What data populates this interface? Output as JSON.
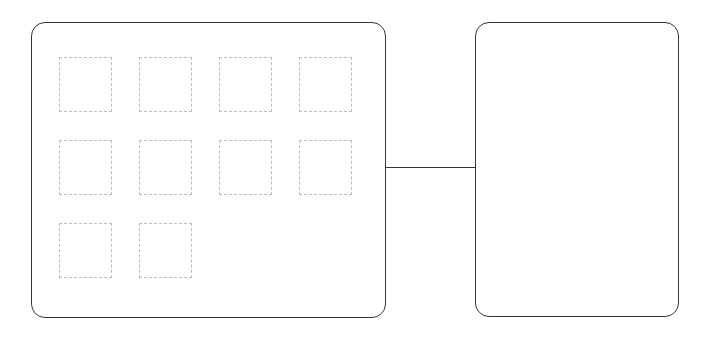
{
  "page": {
    "background_color": "#ffffff",
    "width": 712,
    "height": 339
  },
  "colors": {
    "panel_border": "#343434",
    "placeholder_border": "#bdbdbd",
    "connector": "#343434",
    "surface": "#ffffff"
  },
  "content_panel": {
    "name": "content-panel",
    "label": "",
    "border_style": "solid",
    "corner_radius": 14,
    "x": 31,
    "y": 22,
    "width": 355,
    "height": 296,
    "grid": {
      "rows": [
        {
          "row_index": 1,
          "boxes": [
            {
              "label": "",
              "id": "placeholder-1"
            },
            {
              "label": "",
              "id": "placeholder-2"
            },
            {
              "label": "",
              "id": "placeholder-3"
            },
            {
              "label": "",
              "id": "placeholder-4"
            }
          ]
        },
        {
          "row_index": 2,
          "boxes": [
            {
              "label": "",
              "id": "placeholder-5"
            },
            {
              "label": "",
              "id": "placeholder-6"
            },
            {
              "label": "",
              "id": "placeholder-7"
            },
            {
              "label": "",
              "id": "placeholder-8"
            }
          ]
        },
        {
          "row_index": 3,
          "boxes": [
            {
              "label": "",
              "id": "placeholder-9"
            },
            {
              "label": "",
              "id": "placeholder-10"
            }
          ]
        }
      ],
      "box_count": 10,
      "box_width": 53,
      "box_height": 55,
      "column_gap": 27,
      "row_gap": 28,
      "border_style": "dashed"
    }
  },
  "connector": {
    "name": "connector-line",
    "orientation": "horizontal",
    "from": "content-panel",
    "to": "detail-panel",
    "x": 385,
    "y": 167,
    "length": 91,
    "thickness": 1.4
  },
  "detail_panel": {
    "name": "detail-panel",
    "label": "",
    "border_style": "solid",
    "corner_radius": 14,
    "x": 475,
    "y": 22,
    "width": 204,
    "height": 295,
    "content": ""
  }
}
